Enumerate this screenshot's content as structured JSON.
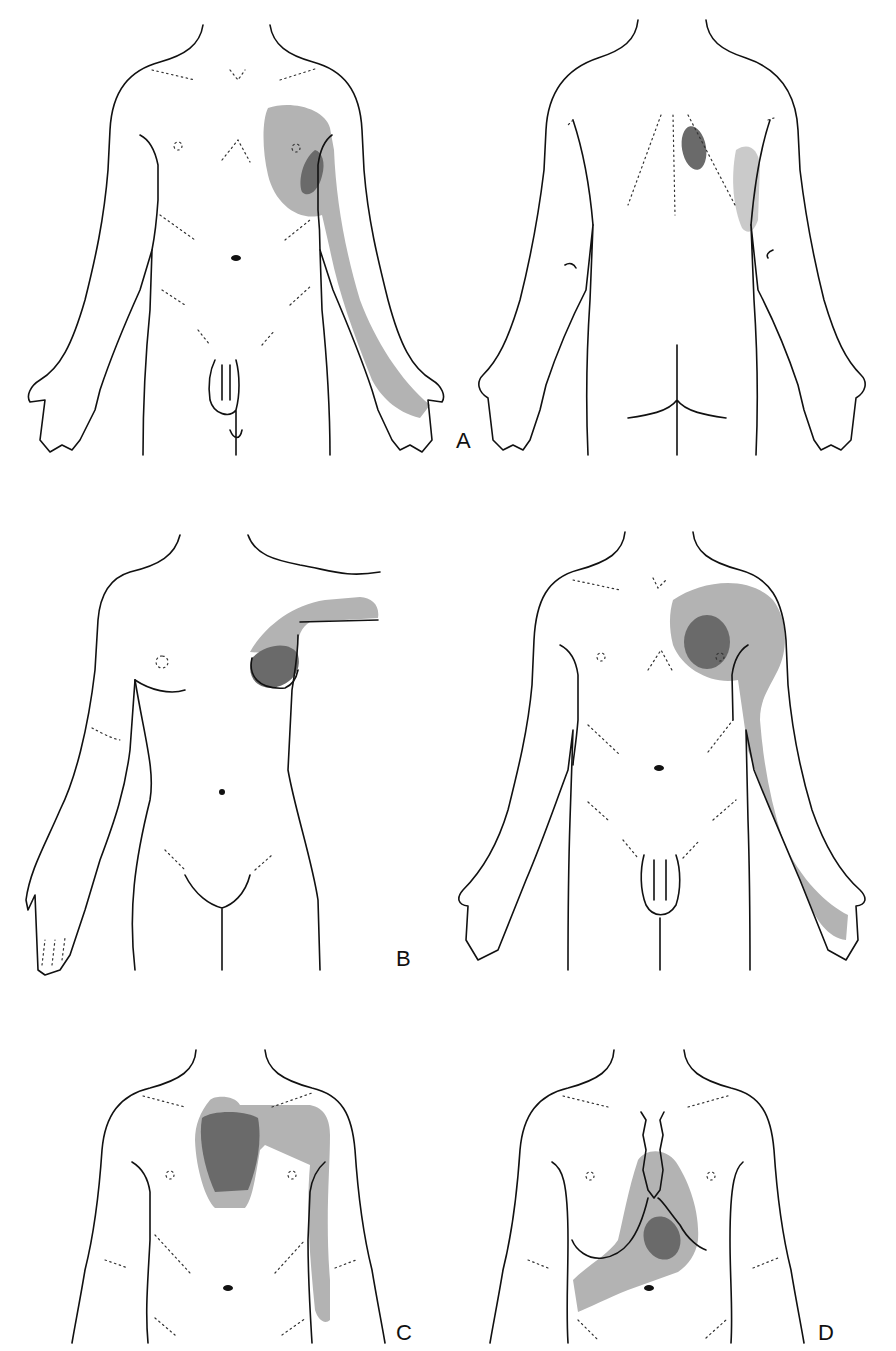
{
  "figure": {
    "type": "referred pain distribution diagrams",
    "panels": [
      {
        "id": "A",
        "label": "A",
        "views": [
          "anterior male",
          "posterior male"
        ],
        "regions": {
          "primary": "left lateral chest / axilla",
          "referred": "left anterior chest, medial left arm to ulnar hand; left scapular area (posterior)"
        }
      },
      {
        "id": "B",
        "label": "B",
        "views": [
          "anterior female (left)",
          "anterior male (right)"
        ],
        "regions": {
          "primary": "left breast / left pectoral",
          "referred": "left shoulder and medial arm to ulnar hand"
        }
      },
      {
        "id": "C",
        "label": "C",
        "views": [
          "anterior torso"
        ],
        "regions": {
          "primary": "retrosternal / upper sternum",
          "referred": "left shoulder and medial left arm"
        }
      },
      {
        "id": "D",
        "label": "D",
        "views": [
          "anterior torso"
        ],
        "regions": {
          "primary": "left lower sternal / precordial",
          "referred": "lower sternum extending to right upper abdomen"
        }
      }
    ],
    "legend": {
      "primary_color": "#6a6a6a",
      "referred_color": "#b3b3b3",
      "outline_color": "#111111"
    }
  }
}
